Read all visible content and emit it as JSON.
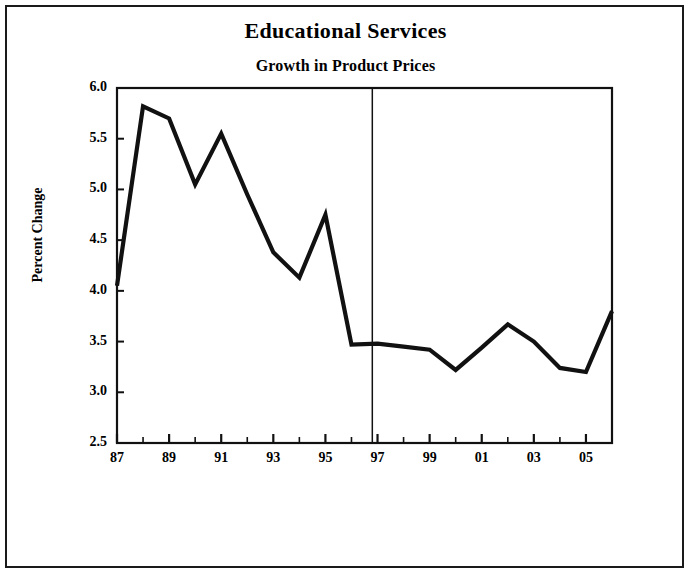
{
  "figure": {
    "width": 691,
    "height": 578,
    "background_color": "#ffffff",
    "border_color": "#1a1a1a",
    "line_color": "#111111"
  },
  "chart_data": {
    "type": "line",
    "title": "Educational Services",
    "subtitle": "Growth in Product Prices",
    "xlabel": "",
    "ylabel": "Percent Change",
    "ylim": [
      2.5,
      6.0
    ],
    "xlim": [
      1987,
      2006
    ],
    "grid": false,
    "legend": null,
    "ytick_labels": [
      "6.0",
      "5.5",
      "5.0",
      "4.5",
      "4.0",
      "3.5",
      "3.0",
      "2.5"
    ],
    "ytick_values": [
      6.0,
      5.5,
      5.0,
      4.5,
      4.0,
      3.5,
      3.0,
      2.5
    ],
    "xtick_values": [
      1987,
      1988,
      1989,
      1990,
      1991,
      1992,
      1993,
      1994,
      1995,
      1996,
      1997,
      1998,
      1999,
      2000,
      2001,
      2002,
      2003,
      2004,
      2005,
      2006
    ],
    "xtick_labels": [
      "87",
      "",
      "89",
      "",
      "91",
      "",
      "93",
      "",
      "95",
      "",
      "97",
      "",
      "99",
      "",
      "01",
      "",
      "03",
      "",
      "05",
      ""
    ],
    "x": [
      1987,
      1988,
      1989,
      1990,
      1991,
      1992,
      1993,
      1994,
      1995,
      1996,
      1997,
      1998,
      1999,
      2000,
      2001,
      2002,
      2003,
      2004,
      2005,
      2006
    ],
    "values": [
      4.05,
      5.82,
      5.7,
      5.05,
      5.55,
      4.95,
      4.38,
      4.13,
      4.75,
      3.47,
      3.48,
      3.45,
      3.42,
      3.22,
      3.44,
      3.67,
      3.5,
      3.24,
      3.2,
      3.8
    ],
    "series": [
      {
        "name": "Growth in Product Prices",
        "values": [
          4.05,
          5.82,
          5.7,
          5.05,
          5.55,
          4.95,
          4.38,
          4.13,
          4.75,
          3.47,
          3.48,
          3.45,
          3.42,
          3.22,
          3.44,
          3.67,
          3.5,
          3.24,
          3.2,
          3.8
        ]
      }
    ],
    "annotations": [
      {
        "type": "vline",
        "name": "history-forecast-divider",
        "x": 1996.8,
        "label": ""
      }
    ]
  }
}
